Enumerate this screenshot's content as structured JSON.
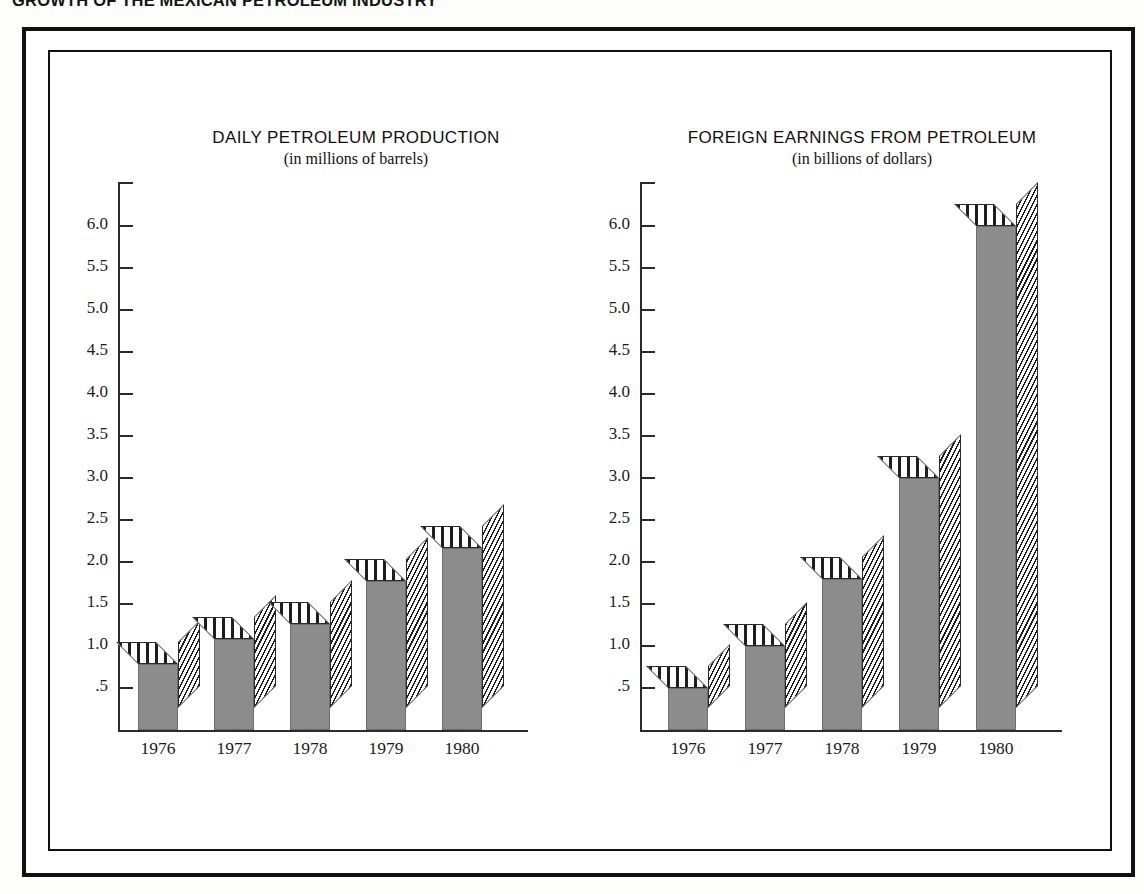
{
  "page": {
    "title": "GROWTH OF THE MEXICAN PETROLEUM INDUSTRY"
  },
  "colors": {
    "bar_fill": "#8c8c8c",
    "hatch_line": "#1d1d1d",
    "frame": "#111111",
    "axis": "#2b2b2b",
    "background": "#ffffff"
  },
  "chart_data": [
    {
      "type": "bar",
      "title": "DAILY PETROLEUM PRODUCTION",
      "subtitle": "(in millions of barrels)",
      "xlabel": "",
      "ylabel": "",
      "categories": [
        "1976",
        "1977",
        "1978",
        "1979",
        "1980"
      ],
      "values": [
        0.78,
        1.08,
        1.26,
        1.77,
        2.17
      ],
      "ytick_labels": [
        "6.0",
        "5.5",
        "5.0",
        "4.5",
        "4.0",
        "3.5",
        "3.0",
        "2.5",
        "2.0",
        "1.5",
        "1.0",
        ".5"
      ],
      "ytick_values": [
        6.0,
        5.5,
        5.0,
        4.5,
        4.0,
        3.5,
        3.0,
        2.5,
        2.0,
        1.5,
        1.0,
        0.5
      ],
      "ylim": [
        0,
        6.5
      ],
      "grid": false,
      "legend": null
    },
    {
      "type": "bar",
      "title": "FOREIGN EARNINGS FROM PETROLEUM",
      "subtitle": "(in billions of dollars)",
      "xlabel": "",
      "ylabel": "",
      "categories": [
        "1976",
        "1977",
        "1978",
        "1979",
        "1980"
      ],
      "values": [
        0.5,
        1.0,
        1.8,
        3.0,
        6.0
      ],
      "ytick_labels": [
        "6.0",
        "5.5",
        "5.0",
        "4.5",
        "4.0",
        "3.5",
        "3.0",
        "2.5",
        "2.0",
        "1.5",
        "1.0",
        ".5"
      ],
      "ytick_values": [
        6.0,
        5.5,
        5.0,
        4.5,
        4.0,
        3.5,
        3.0,
        2.5,
        2.0,
        1.5,
        1.0,
        0.5
      ],
      "ylim": [
        0,
        6.5
      ],
      "grid": false,
      "legend": null
    }
  ]
}
